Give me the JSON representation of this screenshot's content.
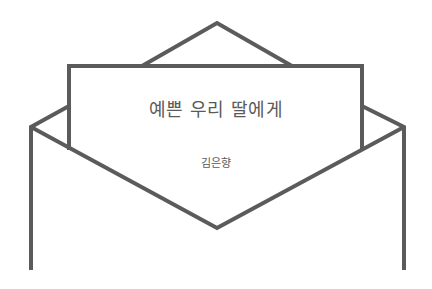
{
  "card": {
    "title": "예쁜 우리 딸에게",
    "author": "김은향"
  },
  "colors": {
    "stroke": "#5b5b5b",
    "text": "#5a5a5a",
    "background": "#ffffff"
  },
  "icons": {
    "illustration": "open-envelope-with-letter"
  }
}
